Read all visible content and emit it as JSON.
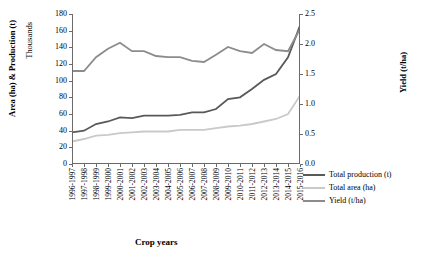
{
  "chart_data": {
    "type": "line",
    "title": "",
    "xlabel": "Crop years",
    "ylabel_left": "Area (ha) & Production (t)",
    "ylabel_left_secondary": "Thousands",
    "ylabel_right": "Yield (t/ha)",
    "categories": [
      "1996-1997",
      "1997-1998",
      "1998-1999",
      "1999-2000",
      "2000-2001",
      "2001-2002",
      "2002-2003",
      "2003-2004",
      "2004-2005",
      "2005-2006",
      "2006-2007",
      "2007-2008",
      "2008-2009",
      "2009-2010",
      "2010-2011",
      "2011-2012",
      "2012-2013",
      "2013-2014",
      "2014-2015",
      "2015-2016"
    ],
    "y_left_ticks": [
      0,
      20,
      40,
      60,
      80,
      100,
      120,
      140,
      160,
      180
    ],
    "y_left_lim": [
      0,
      180
    ],
    "y_right_ticks": [
      "0.0",
      "0.5",
      "1.0",
      "1.5",
      "2.0",
      "2.5"
    ],
    "y_right_lim": [
      0,
      2.5
    ],
    "grid": false,
    "legend_position": "right",
    "series": [
      {
        "name": "Total production (t)",
        "axis": "left",
        "color": "#595959",
        "values": [
          38,
          40,
          48,
          51,
          56,
          55,
          58,
          58,
          58,
          59,
          62,
          62,
          66,
          78,
          80,
          90,
          101,
          108,
          128,
          166
        ]
      },
      {
        "name": "Total area (ha)",
        "axis": "left",
        "color": "#c9c9c9",
        "values": [
          27,
          30,
          34,
          35,
          37,
          38,
          39,
          39,
          39,
          41,
          41,
          41,
          43,
          45,
          46,
          48,
          51,
          54,
          60,
          82
        ]
      },
      {
        "name": "Yield (t/ha)",
        "axis": "right",
        "color": "#8c8c8c",
        "values": [
          1.55,
          1.55,
          1.78,
          1.92,
          2.02,
          1.88,
          1.88,
          1.8,
          1.78,
          1.78,
          1.72,
          1.7,
          1.82,
          1.95,
          1.88,
          1.85,
          2.0,
          1.9,
          1.88,
          2.25
        ]
      }
    ]
  },
  "legend": {
    "items": [
      {
        "label": "Total production (t)",
        "color": "#595959"
      },
      {
        "label": "Total area (ha)",
        "color": "#c9c9c9"
      },
      {
        "label": "Yield (t/ha)",
        "color": "#8c8c8c"
      }
    ]
  }
}
